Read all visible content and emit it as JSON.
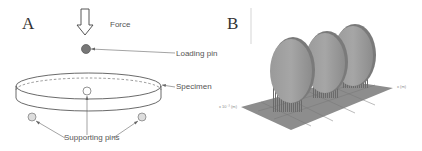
{
  "panel_a": {
    "letter": "A",
    "labels": {
      "force": "Force",
      "loading_pin": "Loading pin",
      "specimen": "Specimen",
      "supporting_pins": "Supporting pins"
    }
  },
  "panel_b": {
    "letter": "B",
    "axis_labels": {
      "left": "x 10⁻³ (m)",
      "right": "x (m)"
    },
    "disc_count": 3
  }
}
